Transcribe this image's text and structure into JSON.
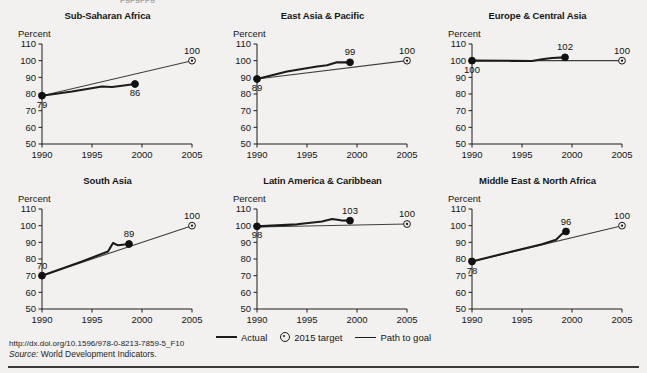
{
  "figure": {
    "clipped_header_text": "pgpgppg",
    "legend": [
      {
        "label": "Actual",
        "marker": "line-thick"
      },
      {
        "label": "2015 target",
        "marker": "target-circle-icon"
      },
      {
        "label": "Path to goal",
        "marker": "line-thin"
      }
    ],
    "doi": "http://dx.doi.org/10.1596/978-0-8213-7859-5_F10",
    "source_prefix": "Source:",
    "source_text": "World Development Indicators."
  },
  "chart_data": [
    {
      "type": "line",
      "title": "Sub-Saharan Africa",
      "ylabel": "Percent",
      "xlabel": "",
      "xlim": [
        1990,
        2005
      ],
      "ylim": [
        50,
        110
      ],
      "yticks": [
        50,
        60,
        70,
        80,
        90,
        100,
        110
      ],
      "xticks": [
        1990,
        1995,
        2000,
        2005
      ],
      "grid": false,
      "legend_position": "figure-bottom-center",
      "series": [
        {
          "name": "Actual",
          "x": [
            1990,
            1993,
            1996,
            1997,
            1998,
            1999.3
          ],
          "values": [
            79,
            81.5,
            84.5,
            84.2,
            85.0,
            86
          ]
        },
        {
          "name": "Path to goal",
          "x": [
            1990,
            2005
          ],
          "values": [
            79,
            100
          ]
        }
      ],
      "point_labels": [
        {
          "text": "79",
          "x": 1990,
          "y": 79,
          "position": "below"
        },
        {
          "text": "86",
          "x": 1999.3,
          "y": 86,
          "position": "below"
        },
        {
          "text": "100",
          "x": 2005,
          "y": 100,
          "position": "above"
        }
      ],
      "target": {
        "x": 2005,
        "y": 100,
        "value": 100
      }
    },
    {
      "type": "line",
      "title": "East Asia & Pacific",
      "ylabel": "Percent",
      "xlabel": "",
      "xlim": [
        1990,
        2005
      ],
      "ylim": [
        50,
        110
      ],
      "yticks": [
        50,
        60,
        70,
        80,
        90,
        100,
        110
      ],
      "xticks": [
        1990,
        1995,
        2000,
        2005
      ],
      "grid": false,
      "legend_position": "figure-bottom-center",
      "series": [
        {
          "name": "Actual",
          "x": [
            1990,
            1993,
            1996,
            1997,
            1998,
            1999.3
          ],
          "values": [
            89,
            93.5,
            96.5,
            97.2,
            99.0,
            99
          ]
        },
        {
          "name": "Path to goal",
          "x": [
            1990,
            2005
          ],
          "values": [
            89,
            100
          ]
        }
      ],
      "point_labels": [
        {
          "text": "89",
          "x": 1990,
          "y": 89,
          "position": "below"
        },
        {
          "text": "99",
          "x": 1999.3,
          "y": 99,
          "position": "above"
        },
        {
          "text": "100",
          "x": 2005,
          "y": 100,
          "position": "above"
        }
      ],
      "target": {
        "x": 2005,
        "y": 100,
        "value": 100
      }
    },
    {
      "type": "line",
      "title": "Europe & Central Asia",
      "ylabel": "Percent",
      "xlabel": "",
      "xlim": [
        1990,
        2005
      ],
      "ylim": [
        50,
        110
      ],
      "yticks": [
        50,
        60,
        70,
        80,
        90,
        100,
        110
      ],
      "xticks": [
        1990,
        1995,
        2000,
        2005
      ],
      "grid": false,
      "legend_position": "figure-bottom-center",
      "series": [
        {
          "name": "Actual",
          "x": [
            1990,
            1994,
            1996,
            1997,
            1998,
            1999.3
          ],
          "values": [
            100,
            99.9,
            99.8,
            100.8,
            101.6,
            102
          ]
        },
        {
          "name": "Path to goal",
          "x": [
            1990,
            2005
          ],
          "values": [
            100,
            100
          ]
        }
      ],
      "point_labels": [
        {
          "text": "100",
          "x": 1990,
          "y": 100,
          "position": "below"
        },
        {
          "text": "102",
          "x": 1999.3,
          "y": 102,
          "position": "above"
        },
        {
          "text": "100",
          "x": 2005,
          "y": 100,
          "position": "above"
        }
      ],
      "target": {
        "x": 2005,
        "y": 100,
        "value": 100
      }
    },
    {
      "type": "line",
      "title": "South Asia",
      "ylabel": "Percent",
      "xlabel": "",
      "xlim": [
        1990,
        2005
      ],
      "ylim": [
        50,
        110
      ],
      "yticks": [
        50,
        60,
        70,
        80,
        90,
        100,
        110
      ],
      "xticks": [
        1990,
        1995,
        2000,
        2005
      ],
      "grid": false,
      "legend_position": "figure-bottom-center",
      "series": [
        {
          "name": "Actual",
          "x": [
            1990,
            1994,
            1996.6,
            1997.1,
            1997.6,
            1998.7
          ],
          "values": [
            70,
            78.5,
            84.5,
            89.6,
            88.2,
            89
          ]
        },
        {
          "name": "Path to goal",
          "x": [
            1990,
            2005
          ],
          "values": [
            70,
            100
          ]
        }
      ],
      "point_labels": [
        {
          "text": "70",
          "x": 1990,
          "y": 70,
          "position": "above"
        },
        {
          "text": "89",
          "x": 1998.7,
          "y": 89,
          "position": "above"
        },
        {
          "text": "100",
          "x": 2005,
          "y": 100,
          "position": "above"
        }
      ],
      "target": {
        "x": 2005,
        "y": 100,
        "value": 100
      }
    },
    {
      "type": "line",
      "title": "Latin America & Caribbean",
      "ylabel": "Percent",
      "xlabel": "",
      "xlim": [
        1990,
        2005
      ],
      "ylim": [
        50,
        110
      ],
      "yticks": [
        50,
        60,
        70,
        80,
        90,
        100,
        110
      ],
      "xticks": [
        1990,
        1995,
        2000,
        2005
      ],
      "grid": false,
      "legend_position": "figure-bottom-center",
      "series": [
        {
          "name": "Actual",
          "x": [
            1990,
            1994,
            1996.5,
            1997.5,
            1998.4,
            1999.3
          ],
          "values": [
            99.6,
            100.8,
            102.5,
            104.0,
            103.2,
            103
          ]
        },
        {
          "name": "Path to goal",
          "x": [
            1990,
            2005
          ],
          "values": [
            99.2,
            101
          ]
        }
      ],
      "point_labels": [
        {
          "text": "98",
          "x": 1990,
          "y": 99.6,
          "position": "below"
        },
        {
          "text": "103",
          "x": 1999.3,
          "y": 103,
          "position": "above"
        },
        {
          "text": "100",
          "x": 2005,
          "y": 101,
          "position": "above"
        }
      ],
      "target": {
        "x": 2005,
        "y": 101,
        "value": 100
      }
    },
    {
      "type": "line",
      "title": "Middle East & North Africa",
      "ylabel": "Percent",
      "xlabel": "",
      "xlim": [
        1990,
        2005
      ],
      "ylim": [
        50,
        110
      ],
      "yticks": [
        50,
        60,
        70,
        80,
        90,
        100,
        110
      ],
      "xticks": [
        1990,
        1995,
        2000,
        2005
      ],
      "grid": false,
      "legend_position": "figure-bottom-center",
      "series": [
        {
          "name": "Actual",
          "x": [
            1990,
            1994,
            1997,
            1998.4,
            1999.0,
            1999.4
          ],
          "values": [
            78.5,
            84.5,
            88.8,
            91.5,
            95.0,
            96.5
          ]
        },
        {
          "name": "Path to goal",
          "x": [
            1990,
            2005
          ],
          "values": [
            78.5,
            100
          ]
        }
      ],
      "point_labels": [
        {
          "text": "78",
          "x": 1990,
          "y": 78.5,
          "position": "below"
        },
        {
          "text": "96",
          "x": 1999.4,
          "y": 96.5,
          "position": "above"
        },
        {
          "text": "100",
          "x": 2005,
          "y": 100,
          "position": "above"
        }
      ],
      "target": {
        "x": 2005,
        "y": 100,
        "value": 100
      }
    }
  ]
}
